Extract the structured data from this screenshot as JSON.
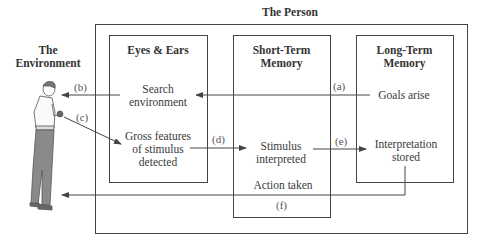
{
  "title": "The Person",
  "environment": {
    "label_line1": "The",
    "label_line2": "Environment"
  },
  "boxes": {
    "eyes_ears": {
      "title": "Eyes & Ears"
    },
    "short_term": {
      "title_line1": "Short-Term",
      "title_line2": "Memory"
    },
    "long_term": {
      "title_line1": "Long-Term",
      "title_line2": "Memory"
    }
  },
  "nodes": {
    "search_environment": {
      "line1": "Search",
      "line2": "environment"
    },
    "gross_features": {
      "line1": "Gross features",
      "line2": "of stimulus",
      "line3": "detected"
    },
    "stimulus_interpreted": {
      "line1": "Stimulus",
      "line2": "interpreted"
    },
    "goals_arise": {
      "line1": "Goals arise"
    },
    "interpretation_stored": {
      "line1": "Interpretation",
      "line2": "stored"
    },
    "action_taken": {
      "line1": "Action taken"
    }
  },
  "arrow_labels": {
    "a": "(a)",
    "b": "(b)",
    "c": "(c)",
    "d": "(d)",
    "e": "(e)",
    "f": "(f)"
  },
  "colors": {
    "line": "#444444",
    "text": "#3a3a3a",
    "figure_pants": "#8a8a8a"
  }
}
